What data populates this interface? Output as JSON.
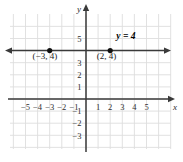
{
  "figure": {
    "width": 183,
    "height": 162,
    "background_color": "#ffffff"
  },
  "chart_data": {
    "type": "line",
    "title": "",
    "subtitle": "",
    "xlabel": "x",
    "ylabel": "y",
    "xlim": [
      -6,
      6
    ],
    "ylim": [
      -4,
      6
    ],
    "grid": true,
    "grid_color": "#dedede",
    "grid_step": 1,
    "legend": "none",
    "axis_color": "#3a3a3a",
    "series_color": "#3a3a3a",
    "point_color": "#111111",
    "equation": "y = 4",
    "xticks": [
      -5,
      -4,
      -3,
      -2,
      -1,
      1,
      2,
      3,
      4,
      5
    ],
    "xtick_labels": [
      "−5",
      "−4",
      "−3",
      "−2",
      "−1",
      "1",
      "2",
      "3",
      "4",
      "5"
    ],
    "yticks": [
      5,
      3,
      2,
      1,
      -1,
      -2,
      -3
    ],
    "ytick_labels": [
      "5",
      "3",
      "2",
      "1",
      "−1",
      "−2",
      "−3"
    ],
    "series": [
      {
        "name": "y = 4",
        "kind": "horizontal-line",
        "y": 4,
        "x_from": -6,
        "x_to": 6,
        "arrow_start": true,
        "arrow_end": true,
        "label": "y = 4",
        "label_x": 3.3,
        "label_y": 5.0
      }
    ],
    "points": [
      {
        "x": -3,
        "y": 4,
        "label": "(−3, 4)",
        "label_x": -3.4,
        "label_y": 3.3
      },
      {
        "x": 2,
        "y": 4,
        "label": "(2, 4)",
        "label_x": 1.7,
        "label_y": 3.3
      }
    ]
  },
  "axis_labels": {
    "x": "x",
    "y": "y"
  }
}
